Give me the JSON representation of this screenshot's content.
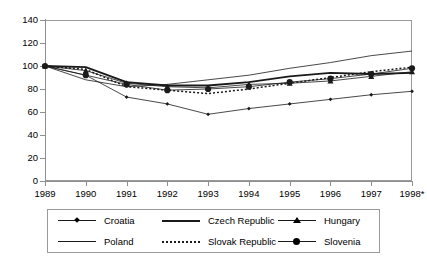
{
  "chart_data": {
    "type": "line",
    "title": "",
    "subtitle": "",
    "xlabel": "",
    "ylabel": "",
    "grid": true,
    "legend_position": "bottom",
    "x": [
      "1989",
      "1990",
      "1991",
      "1992",
      "1993",
      "1994",
      "1995",
      "1996",
      "1997",
      "1998*"
    ],
    "categories": [
      "1989",
      "1990",
      "1991",
      "1992",
      "1993",
      "1994",
      "1995",
      "1996",
      "1997",
      "1998*"
    ],
    "ylim": [
      0,
      140
    ],
    "yticks": [
      0,
      20,
      40,
      60,
      80,
      100,
      120,
      140
    ],
    "xlim_index": [
      0,
      9
    ],
    "note": "Index of real GDP, 1989 = 100",
    "series": [
      {
        "name": "Croatia",
        "style": "thin-line-with-diamond-marker",
        "marker": "diamond",
        "values": [
          100,
          92,
          73,
          67,
          58,
          63,
          67,
          71,
          75,
          78
        ]
      },
      {
        "name": "Czech Republic",
        "style": "thick-solid-line",
        "marker": "none",
        "values": [
          100,
          99,
          86,
          83,
          83,
          86,
          91,
          94,
          93,
          94
        ]
      },
      {
        "name": "Hungary",
        "style": "thin-line-with-triangle-marker",
        "marker": "triangle",
        "values": [
          100,
          96,
          85,
          82,
          81,
          84,
          85,
          87,
          91,
          95
        ]
      },
      {
        "name": "Poland",
        "style": "thin-plain-line",
        "marker": "none",
        "values": [
          100,
          88,
          82,
          84,
          88,
          92,
          98,
          103,
          109,
          113
        ]
      },
      {
        "name": "Slovak Republic",
        "style": "dotted-line",
        "marker": "none",
        "values": [
          100,
          97,
          82,
          79,
          76,
          80,
          85,
          90,
          95,
          99
        ]
      },
      {
        "name": "Slovenia",
        "style": "thin-line-with-circle-marker",
        "marker": "circle",
        "values": [
          100,
          92,
          84,
          79,
          80,
          82,
          86,
          89,
          93,
          98
        ]
      }
    ]
  },
  "legend": {
    "entries": [
      {
        "label": "Croatia",
        "sample": "line-diamond"
      },
      {
        "label": "Czech Republic",
        "sample": "line-thick"
      },
      {
        "label": "Hungary",
        "sample": "line-triangle"
      },
      {
        "label": "Poland",
        "sample": "line-thin"
      },
      {
        "label": "Slovak Republic",
        "sample": "line-dotted"
      },
      {
        "label": "Slovenia",
        "sample": "line-circle"
      }
    ]
  },
  "colors": {
    "line": "#1a1a1a",
    "axis": "#8f8f8f",
    "grid": "#b9b9b9",
    "background": "#ffffff",
    "text": "#000000"
  }
}
